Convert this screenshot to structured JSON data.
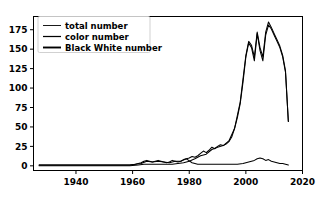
{
  "figure": {
    "background_color": "#ffffff",
    "line_color": "#000000",
    "frame_color": "#000000"
  },
  "chart_data": {
    "type": "line",
    "title": "",
    "xlabel": "",
    "ylabel": "",
    "xlim": [
      1925,
      2020
    ],
    "ylim": [
      -6,
      192
    ],
    "grid": false,
    "legend_position": "upper left",
    "xticks": [
      1940,
      1960,
      1980,
      2000,
      2020
    ],
    "xtick_labels": [
      "1940",
      "1960",
      "1980",
      "2000",
      "2020"
    ],
    "yticks": [
      0,
      25,
      50,
      75,
      100,
      125,
      150,
      175
    ],
    "ytick_labels": [
      "0",
      "25",
      "50",
      "75",
      "100",
      "125",
      "150",
      "175"
    ],
    "legend": [
      "total number",
      "color number",
      "Black White number"
    ],
    "series": [
      {
        "name": "total number",
        "color": "#000000",
        "x": [
          1927,
          1929,
          1931,
          1933,
          1935,
          1937,
          1939,
          1941,
          1943,
          1945,
          1947,
          1949,
          1951,
          1953,
          1955,
          1957,
          1959,
          1961,
          1962,
          1963,
          1964,
          1965,
          1966,
          1967,
          1968,
          1969,
          1970,
          1971,
          1972,
          1973,
          1974,
          1975,
          1976,
          1977,
          1978,
          1979,
          1980,
          1981,
          1982,
          1983,
          1984,
          1985,
          1986,
          1987,
          1988,
          1989,
          1990,
          1991,
          1992,
          1993,
          1994,
          1995,
          1996,
          1997,
          1998,
          1999,
          2000,
          2001,
          2002,
          2003,
          2004,
          2005,
          2006,
          2007,
          2008,
          2009,
          2010,
          2011,
          2012,
          2013,
          2014,
          2015
        ],
        "y": [
          1,
          1,
          1,
          1,
          1,
          1,
          1,
          1,
          1,
          1,
          1,
          1,
          1,
          1,
          1,
          1,
          1,
          2,
          3,
          4,
          6,
          7,
          6,
          5,
          6,
          7,
          6,
          5,
          4,
          5,
          7,
          6,
          5,
          6,
          8,
          9,
          10,
          12,
          11,
          13,
          16,
          19,
          17,
          20,
          24,
          22,
          25,
          27,
          26,
          28,
          31,
          37,
          48,
          62,
          80,
          108,
          140,
          158,
          152,
          135,
          170,
          148,
          135,
          168,
          181,
          176,
          168,
          160,
          152,
          140,
          120,
          57
        ]
      },
      {
        "name": "color number",
        "color": "#000000",
        "x": [
          1927,
          1931,
          1935,
          1939,
          1943,
          1947,
          1951,
          1955,
          1959,
          1962,
          1964,
          1966,
          1968,
          1970,
          1972,
          1974,
          1976,
          1978,
          1980,
          1982,
          1984,
          1986,
          1988,
          1990,
          1992,
          1994,
          1996,
          1998,
          2000,
          2001,
          2002,
          2003,
          2004,
          2005,
          2006,
          2007,
          2008,
          2009,
          2010,
          2011,
          2012,
          2013,
          2014,
          2015
        ],
        "y": [
          0,
          0,
          0,
          0,
          0,
          0,
          0,
          0,
          0,
          1,
          2,
          2,
          2,
          2,
          2,
          2,
          3,
          4,
          6,
          9,
          13,
          15,
          21,
          24,
          26,
          32,
          48,
          82,
          142,
          160,
          155,
          140,
          172,
          152,
          140,
          172,
          185,
          178,
          170,
          162,
          154,
          142,
          122,
          57
        ]
      },
      {
        "name": "Black White number",
        "color": "#000000",
        "x": [
          1927,
          1931,
          1935,
          1939,
          1943,
          1947,
          1951,
          1955,
          1959,
          1961,
          1963,
          1965,
          1967,
          1969,
          1971,
          1973,
          1975,
          1977,
          1979,
          1981,
          1983,
          1985,
          1987,
          1989,
          1991,
          1993,
          1995,
          1997,
          1999,
          2000,
          2001,
          2002,
          2003,
          2004,
          2005,
          2006,
          2007,
          2008,
          2009,
          2010,
          2011,
          2012,
          2013,
          2014,
          2015
        ],
        "y": [
          1,
          1,
          1,
          1,
          1,
          1,
          1,
          1,
          1,
          2,
          3,
          6,
          5,
          6,
          5,
          4,
          6,
          6,
          9,
          4,
          2,
          2,
          2,
          2,
          2,
          2,
          2,
          2,
          3,
          4,
          5,
          6,
          7,
          9,
          10,
          9,
          7,
          8,
          6,
          5,
          4,
          3,
          3,
          2,
          1
        ]
      }
    ]
  }
}
